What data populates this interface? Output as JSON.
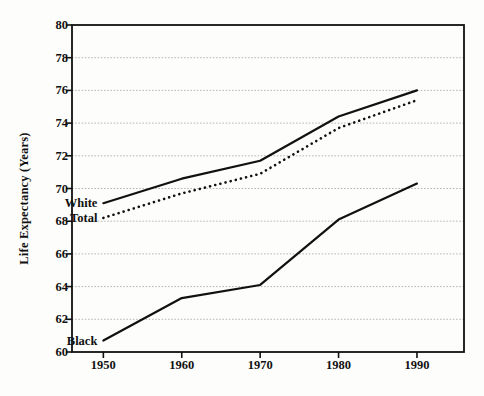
{
  "chart_data": {
    "type": "line",
    "title": "",
    "xlabel": "",
    "ylabel": "Life Expectancy (Years)",
    "x": [
      1950,
      1960,
      1970,
      1980,
      1990
    ],
    "xtick_labels": [
      "1950",
      "1960",
      "1970",
      "1980",
      "1990"
    ],
    "ytick_labels": [
      "60",
      "62",
      "64",
      "66",
      "68",
      "70",
      "72",
      "74",
      "76",
      "78",
      "80"
    ],
    "yticks": [
      60,
      62,
      64,
      66,
      68,
      70,
      72,
      74,
      76,
      78,
      80
    ],
    "xlim": [
      1946,
      1996
    ],
    "ylim": [
      60,
      80
    ],
    "grid": true,
    "grid_axis": "y",
    "grid_style": "dotted",
    "legend": "inline-annotations",
    "series": [
      {
        "name": "White",
        "style": "solid",
        "color": "#111111",
        "values": [
          69.1,
          70.6,
          71.7,
          74.4,
          76.0
        ]
      },
      {
        "name": "Total",
        "style": "dotted",
        "color": "#111111",
        "values": [
          68.2,
          69.7,
          70.9,
          73.7,
          75.4
        ]
      },
      {
        "name": "Black",
        "style": "solid",
        "color": "#111111",
        "values": [
          60.7,
          63.3,
          64.1,
          68.1,
          70.3
        ]
      }
    ],
    "annotations": [
      {
        "text": "White",
        "x": 1950,
        "y": 69.1
      },
      {
        "text": "Total",
        "x": 1950,
        "y": 68.2
      },
      {
        "text": "Black",
        "x": 1950,
        "y": 60.7
      }
    ]
  },
  "colors": {
    "background": "#fdfdfb",
    "axis": "#111111",
    "grid": "#b8b8b8",
    "ink": "#111111"
  }
}
